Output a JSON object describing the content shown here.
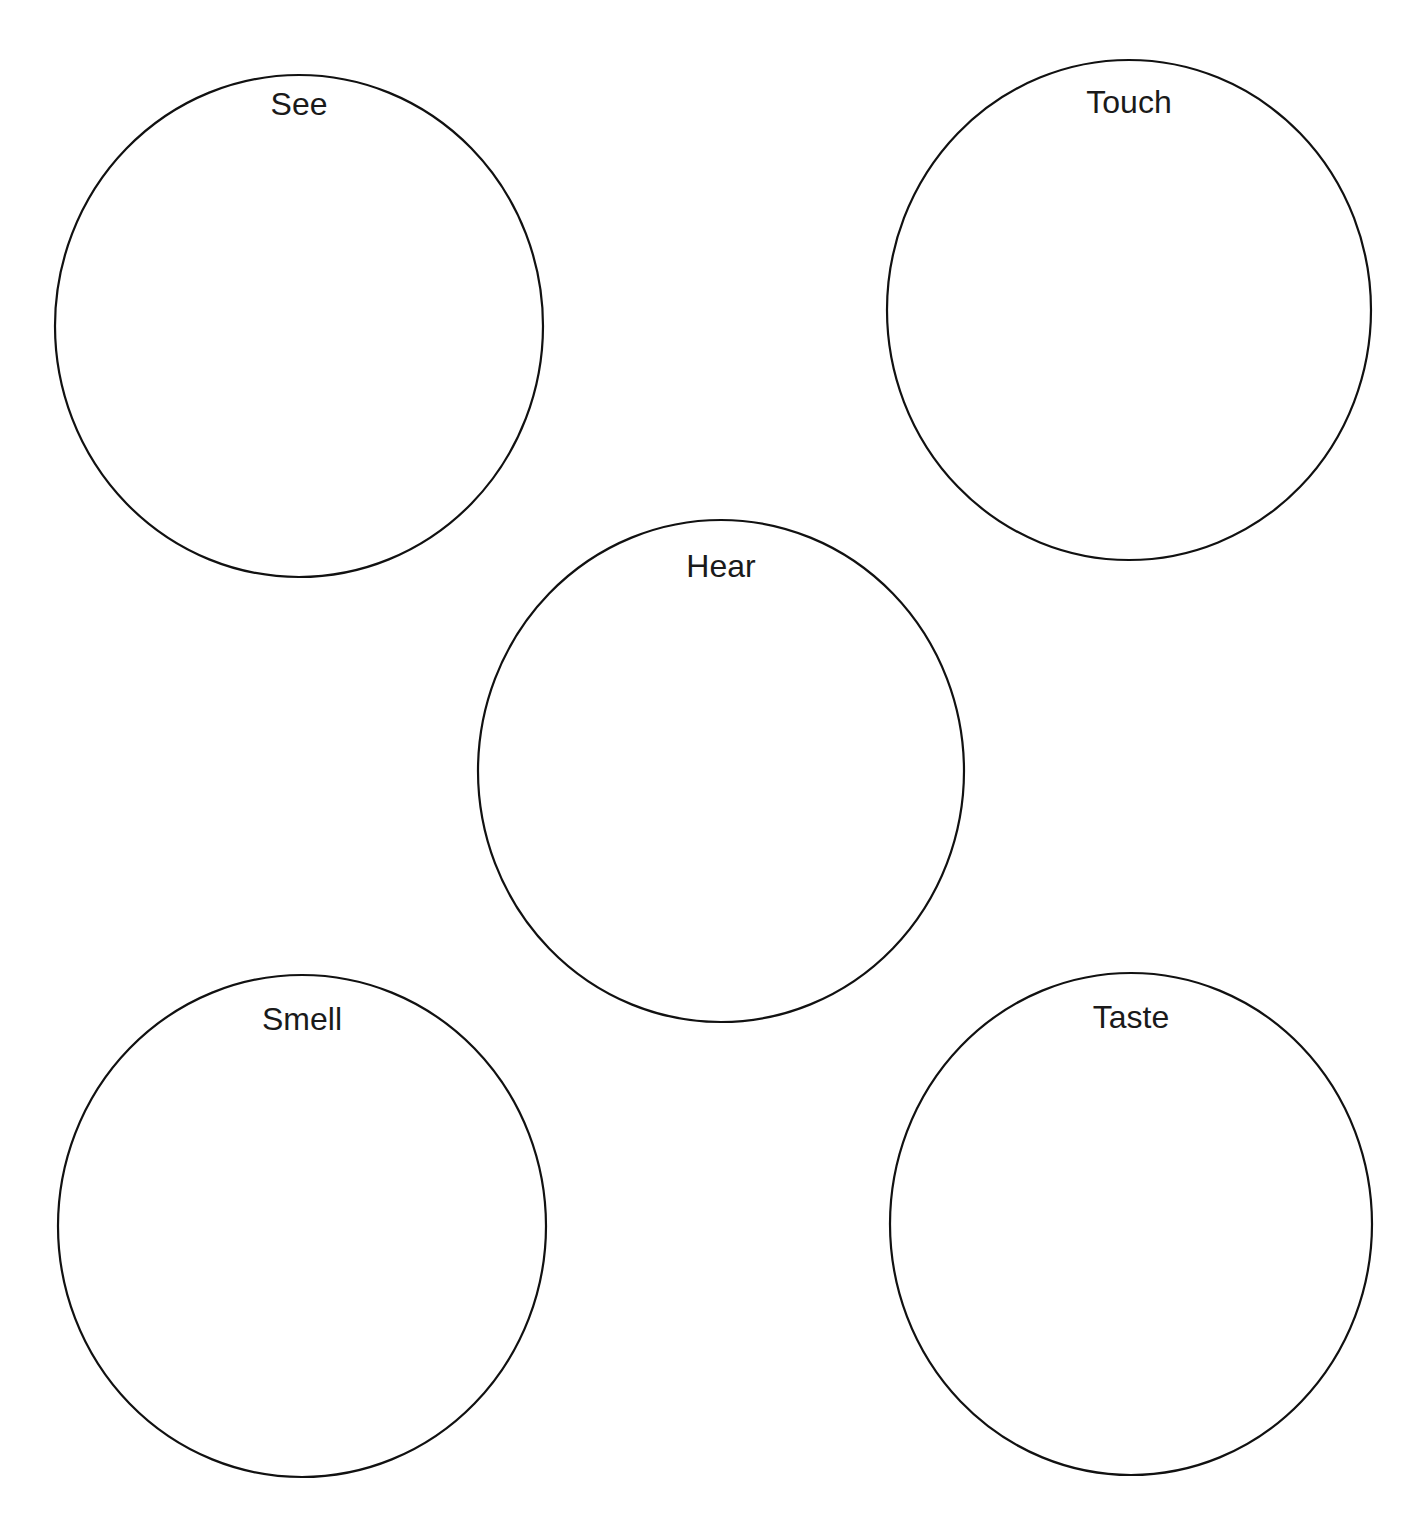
{
  "diagram": {
    "type": "five-senses-graphic-organizer",
    "stroke_color": "#111111",
    "stroke_width": 2.2,
    "background": "#ffffff",
    "circles": [
      {
        "id": "see",
        "label": "See",
        "cx": 299,
        "cy": 326,
        "rx": 244,
        "ry": 251,
        "label_y": 104
      },
      {
        "id": "touch",
        "label": "Touch",
        "cx": 1129,
        "cy": 310,
        "rx": 242,
        "ry": 250,
        "label_y": 102
      },
      {
        "id": "hear",
        "label": "Hear",
        "cx": 721,
        "cy": 771,
        "rx": 243,
        "ry": 251,
        "label_y": 566
      },
      {
        "id": "smell",
        "label": "Smell",
        "cx": 302,
        "cy": 1226,
        "rx": 244,
        "ry": 251,
        "label_y": 1019
      },
      {
        "id": "taste",
        "label": "Taste",
        "cx": 1131,
        "cy": 1224,
        "rx": 241,
        "ry": 251,
        "label_y": 1017
      }
    ]
  }
}
